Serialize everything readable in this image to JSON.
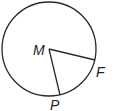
{
  "diagram": {
    "type": "circle-with-radii",
    "center": {
      "label": "M",
      "x": 49,
      "y": 49
    },
    "radius": 47,
    "points": [
      {
        "label": "F",
        "x": 95,
        "y": 60
      },
      {
        "label": "P",
        "x": 60,
        "y": 95
      }
    ],
    "segments": [
      [
        "M",
        "F"
      ],
      [
        "M",
        "P"
      ]
    ],
    "colors": {
      "stroke": "#2a2a2a",
      "background": "#ffffff"
    }
  }
}
